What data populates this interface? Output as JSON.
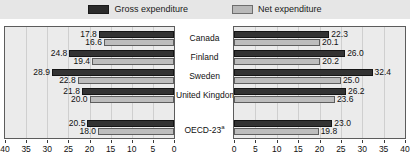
{
  "legend": {
    "items": [
      {
        "label": "Gross expenditure",
        "swatch": "gross",
        "color": "#333333",
        "icon": "legend-swatch-icon"
      },
      {
        "label": "Net expenditure",
        "swatch": "net",
        "color": "#bdbdbd",
        "icon": "legend-swatch-icon"
      }
    ]
  },
  "chart_data": {
    "type": "bar",
    "orientation": "horizontal",
    "layout": "back-to-back mirrored panels sharing centre category labels",
    "title": "",
    "subtitle": "",
    "xlabel": "",
    "ylabel": "",
    "grid": true,
    "legend_position": "top-center",
    "categories": [
      "Canada",
      "Finland",
      "Sweden",
      "United Kingdom",
      "",
      "OECD-23a"
    ],
    "category_labels": [
      "Canada",
      "Finland",
      "Sweden",
      "United Kingdom",
      "",
      "OECD-23"
    ],
    "category_footnote_marks": [
      "",
      "",
      "",
      "",
      "",
      "a"
    ],
    "panels": [
      {
        "name": "left",
        "axis": {
          "ticks": [
            40,
            35,
            30,
            25,
            20,
            15,
            10,
            5,
            0
          ],
          "tick_labels": [
            "40",
            "35",
            "30",
            "25",
            "20",
            "15",
            "10",
            "5",
            "0"
          ],
          "range": [
            40,
            0
          ],
          "direction": "right-to-left"
        },
        "series": [
          {
            "name": "Gross expenditure",
            "color": "#333333",
            "values": [
              17.8,
              24.8,
              28.9,
              21.8,
              null,
              20.5
            ],
            "labels": [
              "17.8",
              "24.8",
              "28.9",
              "21.8",
              "",
              "20.5"
            ]
          },
          {
            "name": "Net expenditure",
            "color": "#bdbdbd",
            "values": [
              16.6,
              19.4,
              22.8,
              20.0,
              null,
              18.0
            ],
            "labels": [
              "16.6",
              "19.4",
              "22.8",
              "20.0",
              "",
              "18.0"
            ]
          }
        ]
      },
      {
        "name": "right",
        "axis": {
          "ticks": [
            0,
            5,
            10,
            15,
            20,
            25,
            30,
            35,
            40
          ],
          "tick_labels": [
            "0",
            "5",
            "10",
            "15",
            "20",
            "25",
            "30",
            "35",
            "40"
          ],
          "range": [
            0,
            40
          ],
          "direction": "left-to-right"
        },
        "series": [
          {
            "name": "Gross expenditure",
            "color": "#333333",
            "values": [
              22.3,
              26.0,
              32.4,
              26.2,
              null,
              23.0
            ],
            "labels": [
              "22.3",
              "26.0",
              "32.4",
              "26.2",
              "",
              "23.0"
            ]
          },
          {
            "name": "Net expenditure",
            "color": "#bdbdbd",
            "values": [
              20.1,
              20.2,
              25.0,
              23.6,
              null,
              19.8
            ],
            "labels": [
              "20.1",
              "20.2",
              "25.0",
              "23.6",
              "",
              "19.8"
            ]
          }
        ]
      }
    ]
  }
}
